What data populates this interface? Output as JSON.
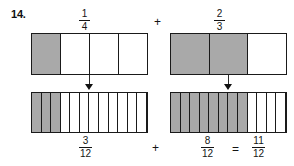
{
  "problem": {
    "number": "14."
  },
  "top_row": {
    "left_fraction": {
      "numerator": "1",
      "denominator": "4"
    },
    "operator": "+",
    "right_fraction": {
      "numerator": "2",
      "denominator": "3"
    }
  },
  "bottom_row": {
    "left_fraction": {
      "numerator": "3",
      "denominator": "12"
    },
    "operator": "+",
    "right_fraction": {
      "numerator": "8",
      "denominator": "12"
    },
    "equals": "=",
    "result_fraction": {
      "numerator": "11",
      "denominator": "12"
    }
  },
  "models": {
    "top_left": {
      "label": "one-fourth-bar",
      "total_parts": 4,
      "shaded_parts": 1
    },
    "top_right": {
      "label": "two-thirds-bar",
      "total_parts": 3,
      "shaded_parts": 2
    },
    "bottom_left": {
      "label": "three-twelfths-bar",
      "total_parts": 12,
      "shaded_parts": 3
    },
    "bottom_right": {
      "label": "eight-twelfths-bar",
      "total_parts": 12,
      "shaded_parts": 8
    }
  },
  "arrows": {
    "left": "down-arrow",
    "right": "down-arrow"
  },
  "colors": {
    "shaded": "#a9a9a9",
    "outline": "#1a1a1a",
    "background": "#ffffff",
    "text": "#141414"
  },
  "chart_data": {
    "type": "bar",
    "title": "",
    "categories": [
      "1/4",
      "2/3",
      "3/12",
      "8/12"
    ],
    "values": [
      0.25,
      0.6667,
      0.25,
      0.6667
    ],
    "series": [
      {
        "name": "shaded_parts",
        "values": [
          1,
          2,
          3,
          8
        ]
      },
      {
        "name": "total_parts",
        "values": [
          4,
          3,
          12,
          12
        ]
      }
    ],
    "xlabel": "",
    "ylabel": "",
    "ylim": [
      0,
      1
    ],
    "grid": false,
    "legend": "none",
    "annotations": [
      "1/4 + 2/3",
      "3/12 + 8/12 = 11/12"
    ]
  }
}
